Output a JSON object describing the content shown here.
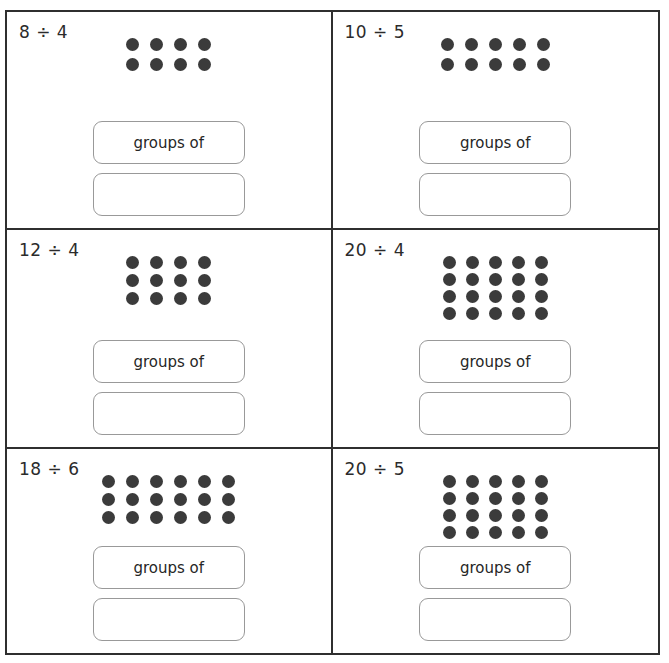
{
  "worksheet": {
    "title": "Division grouping worksheet",
    "group_label": "groups of",
    "answer_placeholder": "",
    "dot_color": "#3b3b3b",
    "border_color": "#2f2f2f",
    "box_border_color": "#999999",
    "problems": [
      {
        "id": "problem-1",
        "expression": "8 ÷ 4",
        "dividend": 8,
        "divisor": 4,
        "dot_columns": 4,
        "dot_rows": 2,
        "spacing": "sp-wide",
        "group_label": "groups of",
        "answer_value": ""
      },
      {
        "id": "problem-2",
        "expression": "10 ÷ 5",
        "dividend": 10,
        "divisor": 5,
        "dot_columns": 5,
        "dot_rows": 2,
        "spacing": "sp-wide",
        "group_label": "groups of",
        "answer_value": ""
      },
      {
        "id": "problem-3",
        "expression": "12 ÷ 4",
        "dividend": 12,
        "divisor": 4,
        "dot_columns": 4,
        "dot_rows": 3,
        "spacing": "sp-med",
        "group_label": "groups of",
        "answer_value": ""
      },
      {
        "id": "problem-4",
        "expression": "20 ÷ 4",
        "dividend": 20,
        "divisor": 4,
        "dot_columns": 5,
        "dot_rows": 4,
        "spacing": "sp-tight",
        "group_label": "groups of",
        "answer_value": ""
      },
      {
        "id": "problem-5",
        "expression": "18 ÷ 6",
        "dividend": 18,
        "divisor": 6,
        "dot_columns": 6,
        "dot_rows": 3,
        "spacing": "sp-med",
        "group_label": "groups of",
        "answer_value": ""
      },
      {
        "id": "problem-6",
        "expression": "20 ÷ 5",
        "dividend": 20,
        "divisor": 5,
        "dot_columns": 5,
        "dot_rows": 4,
        "spacing": "sp-tight",
        "group_label": "groups of",
        "answer_value": ""
      }
    ]
  }
}
